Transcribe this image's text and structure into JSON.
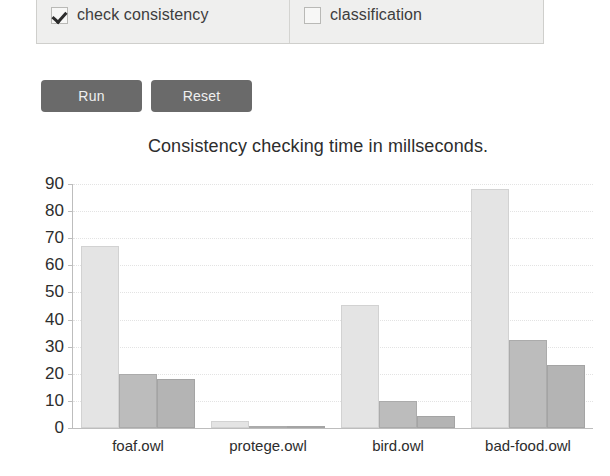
{
  "options_panel": {
    "items": [
      {
        "label": "check consistency",
        "checked": true,
        "icon": "checkmark-icon"
      },
      {
        "label": "classification",
        "checked": false,
        "icon": "empty-checkbox-icon"
      }
    ]
  },
  "buttons": {
    "run_label": "Run",
    "reset_label": "Reset",
    "color": "#6a6a6a",
    "text_color": "#f0f0f0"
  },
  "chart_data": {
    "type": "bar",
    "title": "Consistency checking time in millseconds.",
    "xlabel": "",
    "ylabel": "",
    "ylim": [
      0,
      90
    ],
    "yticks": [
      0,
      10,
      20,
      30,
      40,
      50,
      60,
      70,
      80,
      90
    ],
    "grid": true,
    "legend": null,
    "categories": [
      "foaf.owl",
      "protege.owl",
      "bird.owl",
      "bad-food.owl"
    ],
    "series": [
      {
        "name": "series-1",
        "color": "#e4e4e4",
        "values": [
          67,
          2.5,
          45.5,
          88
        ]
      },
      {
        "name": "series-2",
        "color": "#bcbcbc",
        "values": [
          20,
          0.3,
          9.8,
          32.5
        ]
      },
      {
        "name": "series-3",
        "color": "#b4b4b4",
        "values": [
          18,
          0.3,
          4.3,
          23.3
        ]
      }
    ]
  }
}
